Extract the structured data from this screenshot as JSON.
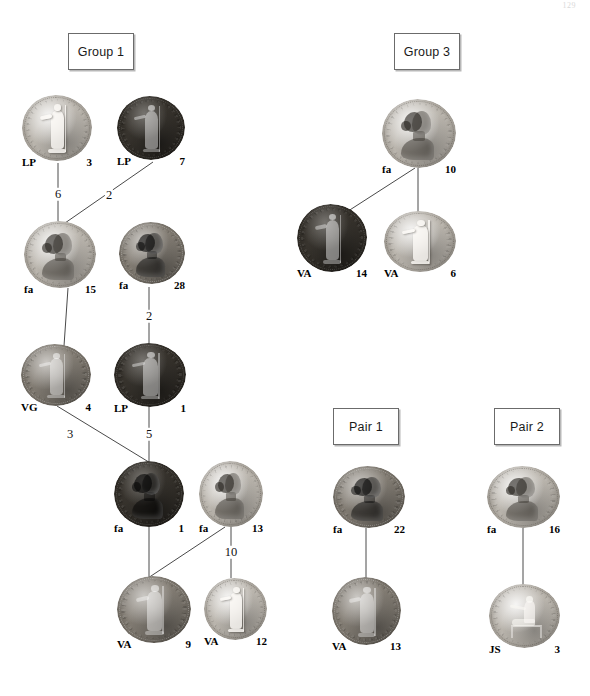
{
  "page": {
    "folio": "129",
    "width": 590,
    "height": 696,
    "background_color": "#ffffff",
    "line_color": "#4a4a4a",
    "box_border_color": "#6b6b6b"
  },
  "groups": [
    {
      "id": "group-1",
      "label": "Group 1",
      "x": 68,
      "y": 33,
      "w": 66,
      "h": 37
    },
    {
      "id": "group-3",
      "label": "Group 3",
      "x": 394,
      "y": 33,
      "w": 66,
      "h": 37
    },
    {
      "id": "pair-1",
      "label": "Pair 1",
      "x": 333,
      "y": 408,
      "w": 66,
      "h": 37
    },
    {
      "id": "pair-2",
      "label": "Pair 2",
      "x": 494,
      "y": 408,
      "w": 66,
      "h": 37
    }
  ],
  "coins": [
    {
      "id": "n-lp-3",
      "side": "LP",
      "number": "3",
      "x": 22,
      "y": 95,
      "w": 70,
      "h": 66,
      "tone": "tone-light",
      "device": "standing",
      "group": "group-1"
    },
    {
      "id": "n-lp-7",
      "side": "LP",
      "number": "7",
      "x": 117,
      "y": 96,
      "w": 68,
      "h": 64,
      "tone": "tone-dark",
      "device": "standing",
      "group": "group-1"
    },
    {
      "id": "n-fa-15",
      "side": "fa",
      "number": "15",
      "x": 24,
      "y": 221,
      "w": 72,
      "h": 67,
      "tone": "tone-light",
      "device": "portrait",
      "group": "group-1"
    },
    {
      "id": "n-fa-28",
      "side": "fa",
      "number": "28",
      "x": 119,
      "y": 222,
      "w": 66,
      "h": 62,
      "tone": "tone-mid",
      "device": "portrait",
      "group": "group-1"
    },
    {
      "id": "n-vg-4",
      "side": "VG",
      "number": "4",
      "x": 21,
      "y": 344,
      "w": 70,
      "h": 62,
      "tone": "tone-mid",
      "device": "standing",
      "group": "group-1"
    },
    {
      "id": "n-lp-1",
      "side": "LP",
      "number": "1",
      "x": 114,
      "y": 343,
      "w": 72,
      "h": 64,
      "tone": "tone-dark",
      "device": "standing",
      "group": "group-1"
    },
    {
      "id": "n-fa-1",
      "side": "fa",
      "number": "1",
      "x": 114,
      "y": 461,
      "w": 70,
      "h": 66,
      "tone": "tone-dark",
      "device": "portrait",
      "group": "group-1"
    },
    {
      "id": "n-fa-13",
      "side": "fa",
      "number": "13",
      "x": 199,
      "y": 461,
      "w": 64,
      "h": 66,
      "tone": "tone-light",
      "device": "portrait",
      "group": "group-1"
    },
    {
      "id": "n-va-9",
      "side": "VA",
      "number": "9",
      "x": 117,
      "y": 576,
      "w": 74,
      "h": 67,
      "tone": "tone-mid",
      "device": "standing",
      "group": "group-1"
    },
    {
      "id": "n-va-12",
      "side": "VA",
      "number": "12",
      "x": 204,
      "y": 578,
      "w": 63,
      "h": 62,
      "tone": "tone-light",
      "device": "standing",
      "group": "group-1"
    },
    {
      "id": "n-fa-10",
      "side": "fa",
      "number": "10",
      "x": 382,
      "y": 99,
      "w": 74,
      "h": 69,
      "tone": "tone-light",
      "device": "portrait",
      "group": "group-3"
    },
    {
      "id": "n-va-14",
      "side": "VA",
      "number": "14",
      "x": 297,
      "y": 204,
      "w": 70,
      "h": 68,
      "tone": "tone-dark",
      "device": "standing",
      "group": "group-3"
    },
    {
      "id": "n-va-6",
      "side": "VA",
      "number": "6",
      "x": 384,
      "y": 211,
      "w": 72,
      "h": 61,
      "tone": "tone-light",
      "device": "standing",
      "group": "group-3"
    },
    {
      "id": "n-fa-22",
      "side": "fa",
      "number": "22",
      "x": 333,
      "y": 466,
      "w": 72,
      "h": 62,
      "tone": "tone-mid",
      "device": "portrait",
      "group": "pair-1"
    },
    {
      "id": "n-va-13",
      "side": "VA",
      "number": "13",
      "x": 332,
      "y": 577,
      "w": 69,
      "h": 68,
      "tone": "tone-mid",
      "device": "standing",
      "group": "pair-1"
    },
    {
      "id": "n-fa-16",
      "side": "fa",
      "number": "16",
      "x": 487,
      "y": 466,
      "w": 73,
      "h": 62,
      "tone": "tone-light",
      "device": "portrait",
      "group": "pair-2"
    },
    {
      "id": "n-js-3",
      "side": "JS",
      "number": "3",
      "x": 489,
      "y": 584,
      "w": 71,
      "h": 64,
      "tone": "tone-light",
      "device": "seated",
      "group": "pair-2"
    }
  ],
  "edges": [
    {
      "id": "e-6",
      "from": "n-lp-3",
      "to": "n-fa-15",
      "label": "6",
      "x1": 58,
      "y1": 163,
      "x2": 58,
      "y2": 221,
      "lx": 58,
      "ly": 194
    },
    {
      "id": "e-2a",
      "from": "n-lp-7",
      "to": "n-fa-15",
      "label": "2",
      "x1": 153,
      "y1": 162,
      "x2": 65,
      "y2": 223,
      "lx": 109,
      "ly": 195
    },
    {
      "id": "e-2b",
      "from": "n-fa-28",
      "to": "n-lp-1",
      "label": "2",
      "x1": 149,
      "y1": 287,
      "x2": 149,
      "y2": 345,
      "lx": 149,
      "ly": 316
    },
    {
      "id": "e-3",
      "from": "n-fa-15",
      "to": "n-vg-4",
      "label": "3",
      "x1": 68,
      "y1": 288,
      "x2": 60,
      "y2": 404,
      "lx": 70,
      "ly": 434
    },
    {
      "id": "e-5",
      "from": "n-lp-1",
      "to": "n-fa-1",
      "label": "5",
      "x1": 149,
      "y1": 406,
      "x2": 149,
      "y2": 462,
      "lx": 149,
      "ly": 434
    },
    {
      "id": "e-3b",
      "from": "n-vg-4",
      "to": "n-fa-1",
      "label": "3",
      "x1": 57,
      "y1": 406,
      "x2": 152,
      "y2": 464,
      "lx": 70,
      "ly": 434
    },
    {
      "id": "e-sp",
      "from": "n-fa-1",
      "to": "n-va-9",
      "label": "",
      "x1": 149,
      "y1": 527,
      "x2": 149,
      "y2": 578,
      "lx": 0,
      "ly": 0
    },
    {
      "id": "e-10",
      "from": "n-fa-13",
      "to": "n-va-12",
      "label": "10",
      "x1": 231,
      "y1": 527,
      "x2": 231,
      "y2": 578,
      "lx": 231,
      "ly": 552
    },
    {
      "id": "e-x",
      "from": "n-fa-13",
      "to": "n-va-9",
      "label": "",
      "x1": 225,
      "y1": 527,
      "x2": 148,
      "y2": 578,
      "lx": 0,
      "ly": 0
    },
    {
      "id": "e-g3a",
      "from": "n-fa-10",
      "to": "n-va-14",
      "label": "",
      "x1": 415,
      "y1": 168,
      "x2": 328,
      "y2": 224,
      "lx": 0,
      "ly": 0
    },
    {
      "id": "e-g3b",
      "from": "n-fa-10",
      "to": "n-va-6",
      "label": "",
      "x1": 418,
      "y1": 168,
      "x2": 418,
      "y2": 213,
      "lx": 0,
      "ly": 0
    },
    {
      "id": "e-p1",
      "from": "n-fa-22",
      "to": "n-va-13",
      "label": "",
      "x1": 366,
      "y1": 528,
      "x2": 366,
      "y2": 579,
      "lx": 0,
      "ly": 0
    },
    {
      "id": "e-p2",
      "from": "n-fa-16",
      "to": "n-js-3",
      "label": "",
      "x1": 523,
      "y1": 528,
      "x2": 523,
      "y2": 586,
      "lx": 0,
      "ly": 0
    }
  ]
}
